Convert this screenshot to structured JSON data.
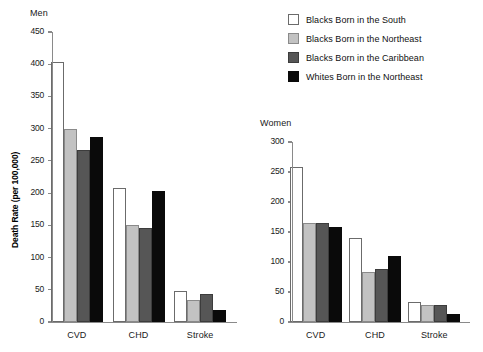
{
  "legend": {
    "position": "top-right",
    "entries": [
      {
        "label": "Blacks Born in the South",
        "color": "#ffffff",
        "swatch": "white-swatch"
      },
      {
        "label": "Blacks Born in the Northeast",
        "color": "#c2c2c2",
        "swatch": "light-gray-swatch"
      },
      {
        "label": "Blacks Born in the Caribbean",
        "color": "#565656",
        "swatch": "dark-gray-swatch"
      },
      {
        "label": "Whites Born in the Northeast",
        "color": "#0a0a0a",
        "swatch": "black-swatch"
      }
    ]
  },
  "men": {
    "title": "Men",
    "ylabel": "Death Rate (per 100,000)",
    "ticks": [
      "450",
      "400",
      "350",
      "300",
      "250",
      "200",
      "150",
      "100",
      "50",
      "0"
    ],
    "categories": [
      "CVD",
      "CHD",
      "Stroke"
    ]
  },
  "women": {
    "title": "Women",
    "ylabel": "",
    "ticks": [
      "300",
      "250",
      "200",
      "150",
      "100",
      "50",
      "0"
    ],
    "categories": [
      "CVD",
      "CHD",
      "Stroke"
    ]
  },
  "chart_data": [
    {
      "type": "bar",
      "title": "Men",
      "xlabel": "",
      "ylabel": "Death Rate (per 100,000)",
      "ylim": [
        0,
        450
      ],
      "ytick_step": 50,
      "grid": false,
      "legend_position": "top-right",
      "categories": [
        "CVD",
        "CHD",
        "Stroke"
      ],
      "series": [
        {
          "name": "Blacks Born in the South",
          "color": "#ffffff",
          "values": [
            403,
            208,
            48
          ]
        },
        {
          "name": "Blacks Born in the Northeast",
          "color": "#c2c2c2",
          "values": [
            299,
            151,
            34
          ]
        },
        {
          "name": "Blacks Born in the Caribbean",
          "color": "#565656",
          "values": [
            267,
            146,
            44
          ]
        },
        {
          "name": "Whites Born in the Northeast",
          "color": "#0a0a0a",
          "values": [
            287,
            204,
            19
          ]
        }
      ]
    },
    {
      "type": "bar",
      "title": "Women",
      "xlabel": "",
      "ylabel": "",
      "ylim": [
        0,
        300
      ],
      "ytick_step": 50,
      "grid": false,
      "legend_position": "top-right",
      "categories": [
        "CVD",
        "CHD",
        "Stroke"
      ],
      "series": [
        {
          "name": "Blacks Born in the South",
          "color": "#ffffff",
          "values": [
            258,
            140,
            34
          ]
        },
        {
          "name": "Blacks Born in the Northeast",
          "color": "#c2c2c2",
          "values": [
            165,
            84,
            29
          ]
        },
        {
          "name": "Blacks Born in the Caribbean",
          "color": "#565656",
          "values": [
            165,
            89,
            29
          ]
        },
        {
          "name": "Whites Born in the Northeast",
          "color": "#0a0a0a",
          "values": [
            158,
            110,
            13
          ]
        }
      ]
    }
  ]
}
